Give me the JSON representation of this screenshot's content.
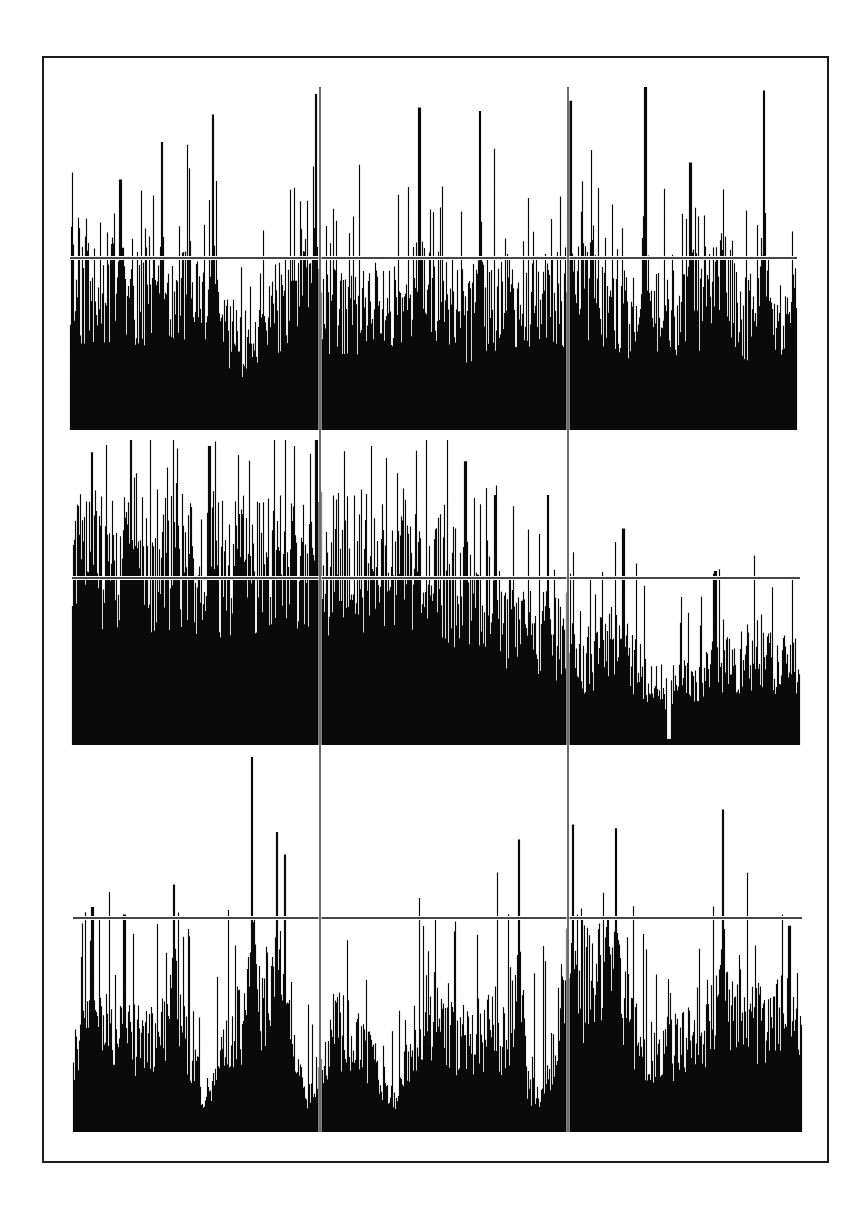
{
  "figure": {
    "frame": {
      "x": 43,
      "y": 57,
      "width": 785,
      "height": 1105,
      "stroke": "#1a1a1a"
    },
    "background": "#ffffff",
    "ink": "#0a0a0a",
    "divider_lines_x": [
      320,
      568
    ]
  },
  "chart_data": [
    {
      "type": "bar",
      "title": "",
      "xlabel": "",
      "ylabel": "",
      "grid": false,
      "legend": null,
      "panel": {
        "x0": 70,
        "x1": 797,
        "baseline_y": 430,
        "threshold_y": 258,
        "top_y": 87
      },
      "threshold_relative": 0.5,
      "description": "Dense spike train (histogram) with many bars crossing the horizontal threshold line; tallest spike near x≈645",
      "envelope": [
        [
          0,
          0.42
        ],
        [
          0.05,
          0.45
        ],
        [
          0.1,
          0.4
        ],
        [
          0.15,
          0.46
        ],
        [
          0.2,
          0.35
        ],
        [
          0.25,
          0.25
        ],
        [
          0.3,
          0.42
        ],
        [
          0.35,
          0.38
        ],
        [
          0.4,
          0.36
        ],
        [
          0.45,
          0.4
        ],
        [
          0.5,
          0.44
        ],
        [
          0.55,
          0.34
        ],
        [
          0.6,
          0.4
        ],
        [
          0.65,
          0.38
        ],
        [
          0.7,
          0.46
        ],
        [
          0.75,
          0.42
        ],
        [
          0.8,
          0.3
        ],
        [
          0.85,
          0.4
        ],
        [
          0.9,
          0.44
        ],
        [
          0.95,
          0.28
        ],
        [
          1.0,
          0.38
        ]
      ],
      "spike_rate": 0.22,
      "seed": 11,
      "peaks": [
        {
          "x": 0.069,
          "h": 0.73
        },
        {
          "x": 0.126,
          "h": 0.84
        },
        {
          "x": 0.196,
          "h": 0.92
        },
        {
          "x": 0.338,
          "h": 0.98
        },
        {
          "x": 0.48,
          "h": 0.94
        },
        {
          "x": 0.563,
          "h": 0.93
        },
        {
          "x": 0.688,
          "h": 0.96
        },
        {
          "x": 0.791,
          "h": 1.0
        },
        {
          "x": 0.853,
          "h": 0.78
        },
        {
          "x": 0.954,
          "h": 0.99
        }
      ]
    },
    {
      "type": "bar",
      "title": "",
      "xlabel": "",
      "ylabel": "",
      "grid": false,
      "legend": null,
      "panel": {
        "x0": 72,
        "x1": 800,
        "baseline_y": 745,
        "threshold_y": 578,
        "top_y": 440
      },
      "threshold_relative": 0.55,
      "description": "Spike train with high sustained activity on left half, decaying to lower bursts on right",
      "envelope": [
        [
          0,
          0.62
        ],
        [
          0.1,
          0.66
        ],
        [
          0.2,
          0.62
        ],
        [
          0.3,
          0.64
        ],
        [
          0.4,
          0.66
        ],
        [
          0.5,
          0.6
        ],
        [
          0.55,
          0.52
        ],
        [
          0.6,
          0.45
        ],
        [
          0.65,
          0.4
        ],
        [
          0.7,
          0.3
        ],
        [
          0.75,
          0.35
        ],
        [
          0.8,
          0.2
        ],
        [
          0.85,
          0.22
        ],
        [
          0.9,
          0.28
        ],
        [
          0.95,
          0.3
        ],
        [
          1.0,
          0.25
        ]
      ],
      "spike_rate": 0.18,
      "seed": 29,
      "peaks": [
        {
          "x": 0.027,
          "h": 0.96
        },
        {
          "x": 0.188,
          "h": 0.98
        },
        {
          "x": 0.335,
          "h": 1.0
        },
        {
          "x": 0.54,
          "h": 0.93
        },
        {
          "x": 0.58,
          "h": 0.82
        },
        {
          "x": 0.653,
          "h": 0.82
        },
        {
          "x": 0.757,
          "h": 0.71
        },
        {
          "x": 0.883,
          "h": 0.57
        }
      ],
      "gaps": [
        0.82
      ]
    },
    {
      "type": "bar",
      "title": "",
      "xlabel": "",
      "ylabel": "",
      "grid": false,
      "legend": null,
      "panel": {
        "x0": 73,
        "x1": 802,
        "baseline_y": 1132,
        "threshold_y": 918,
        "top_y": 757
      },
      "threshold_relative": 0.57,
      "description": "Bursty spike train with distinct clusters and lower baseline activity; several peaks exceed threshold",
      "envelope": [
        [
          0,
          0.25
        ],
        [
          0.05,
          0.3
        ],
        [
          0.1,
          0.25
        ],
        [
          0.14,
          0.38
        ],
        [
          0.18,
          0.1
        ],
        [
          0.22,
          0.3
        ],
        [
          0.28,
          0.4
        ],
        [
          0.32,
          0.1
        ],
        [
          0.36,
          0.3
        ],
        [
          0.4,
          0.25
        ],
        [
          0.44,
          0.08
        ],
        [
          0.48,
          0.35
        ],
        [
          0.52,
          0.25
        ],
        [
          0.58,
          0.3
        ],
        [
          0.64,
          0.08
        ],
        [
          0.68,
          0.4
        ],
        [
          0.74,
          0.45
        ],
        [
          0.78,
          0.22
        ],
        [
          0.84,
          0.25
        ],
        [
          0.9,
          0.38
        ],
        [
          0.95,
          0.3
        ],
        [
          1.0,
          0.35
        ]
      ],
      "spike_rate": 0.15,
      "seed": 47,
      "peaks": [
        {
          "x": 0.026,
          "h": 0.6
        },
        {
          "x": 0.07,
          "h": 0.58
        },
        {
          "x": 0.138,
          "h": 0.66
        },
        {
          "x": 0.245,
          "h": 1.0
        },
        {
          "x": 0.279,
          "h": 0.8
        },
        {
          "x": 0.29,
          "h": 0.74
        },
        {
          "x": 0.611,
          "h": 0.78
        },
        {
          "x": 0.685,
          "h": 0.82
        },
        {
          "x": 0.744,
          "h": 0.81
        },
        {
          "x": 0.891,
          "h": 0.86
        },
        {
          "x": 0.982,
          "h": 0.55
        }
      ]
    }
  ]
}
